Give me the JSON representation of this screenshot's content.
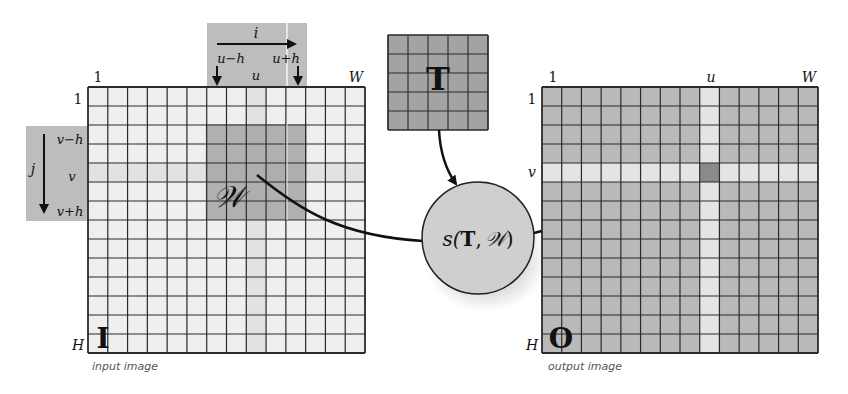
{
  "diagram": {
    "type": "template-matching-schematic",
    "input_image": {
      "symbol": "I",
      "caption": "input image",
      "grid": {
        "cols": 14,
        "rows": 14
      },
      "axis_labels": {
        "col_first": "1",
        "col_last": "W",
        "row_first": "1",
        "row_last": "H"
      },
      "highlight_col_index": 8,
      "highlight_row_index": 4,
      "window": {
        "symbol": "𝒲",
        "col_start": 6,
        "col_end": 10,
        "row_start": 2,
        "row_end": 6
      },
      "top_annotation": {
        "axis": "i",
        "left": "u−h",
        "center": "u",
        "right": "u+h"
      },
      "left_annotation": {
        "axis": "j",
        "top": "v−h",
        "center": "v",
        "bottom": "v+h"
      }
    },
    "template": {
      "symbol": "T",
      "grid": {
        "cols": 5,
        "rows": 5
      }
    },
    "similarity": {
      "label_prefix": "s(",
      "label_T": "T",
      "label_sep": ",",
      "label_W": "𝒲",
      "label_suffix": ")"
    },
    "output_image": {
      "symbol": "O",
      "caption": "output image",
      "grid": {
        "cols": 14,
        "rows": 14
      },
      "axis_labels": {
        "col_first": "1",
        "col_u": "u",
        "col_last": "W",
        "row_first": "1",
        "row_v": "v",
        "row_last": "H"
      },
      "highlight_col_index": 8,
      "highlight_row_index": 4
    },
    "colors": {
      "input_cell": "#efefef",
      "input_highlight": "#e2e2e2",
      "window_fill": "#a9a9a9",
      "annotation_fill": "#bdbdbd",
      "template_fill": "#a3a3a3",
      "circle_fill": "#cfcfcf",
      "output_cell": "#b9b9b9",
      "output_highlight": "#e4e4e4",
      "output_target": "#8a8a8a",
      "grid_line": "#2a2a2a"
    }
  }
}
